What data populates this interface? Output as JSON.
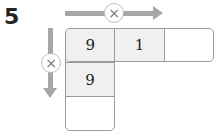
{
  "problem": {
    "number": "5",
    "horizontal_operator": "×",
    "vertical_operator": "×",
    "row_cells": [
      "9",
      "1",
      ""
    ],
    "column_cells": [
      "9",
      "9",
      ""
    ],
    "colors": {
      "arrow": "#a6a6a6",
      "border": "#9a9a9a",
      "filled_cell": "#f0f0f0"
    }
  }
}
